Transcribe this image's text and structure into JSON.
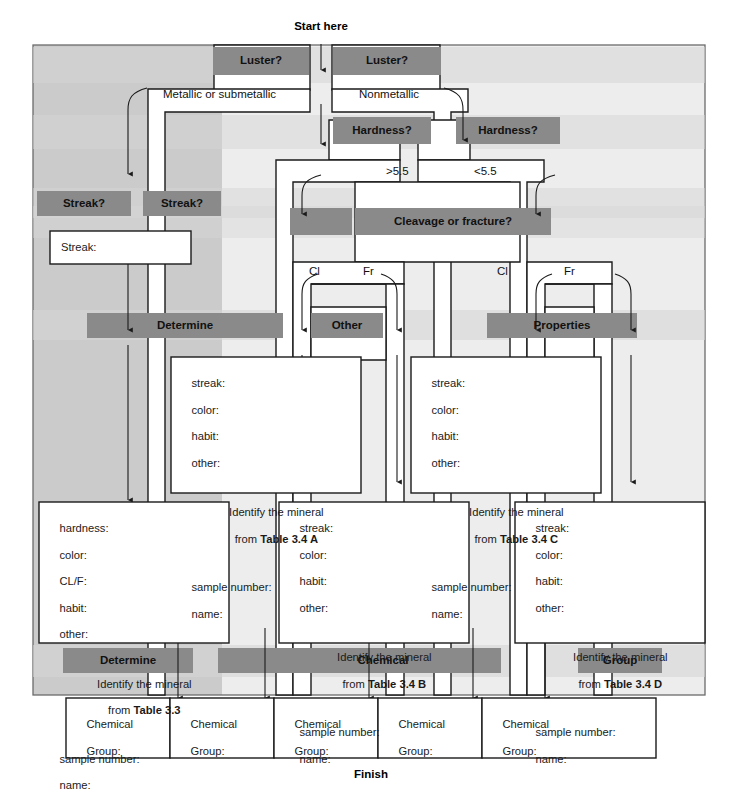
{
  "flow": {
    "start_label": "Start here",
    "finish_label": "Finish"
  },
  "bars": {
    "row_luster": [
      {
        "id": "luster-left",
        "label": "Luster?"
      },
      {
        "id": "luster-right",
        "label": "Luster?"
      }
    ],
    "row_hardness": [
      {
        "id": "hardness-left",
        "label": "Hardness?"
      },
      {
        "id": "hardness-right",
        "label": "Hardness?"
      }
    ],
    "row_streak": [
      {
        "id": "streak-left",
        "label": "Streak?"
      },
      {
        "id": "streak-right",
        "label": "Streak?"
      }
    ],
    "row_cleavage": [
      {
        "id": "cleavage",
        "label": "Cleavage or fracture?"
      }
    ],
    "row_determine_other_properties": [
      {
        "id": "determine",
        "label": "Determine"
      },
      {
        "id": "other",
        "label": "Other"
      },
      {
        "id": "properties",
        "label": "Properties"
      }
    ],
    "row_determine_chemical_group": [
      {
        "id": "determine2",
        "label": "Determine"
      },
      {
        "id": "chemical",
        "label": "Chemical"
      },
      {
        "id": "group",
        "label": "Group"
      }
    ]
  },
  "branch_labels": {
    "metallic": "Metallic or submetallic",
    "nonmetallic": "Nonmetallic",
    "hard_gt": ">5.5",
    "hard_lt": "<5.5",
    "cl_left": "Cl",
    "fr_left": "Fr",
    "cl_right": "Cl",
    "fr_right": "Fr"
  },
  "streak_box": {
    "label": "Streak:"
  },
  "record_boxes": [
    {
      "id": "table-3-4-a",
      "fields": [
        "streak:",
        "color:",
        "habit:",
        "other:"
      ],
      "identify_line1": "Identify the mineral",
      "identify_prefix": "from ",
      "identify_table": "Table 3.4 A",
      "footer": [
        "sample number:",
        "name:"
      ]
    },
    {
      "id": "table-3-4-c",
      "fields": [
        "streak:",
        "color:",
        "habit:",
        "other:"
      ],
      "identify_line1": "Identify the mineral",
      "identify_prefix": "from ",
      "identify_table": "Table 3.4 C",
      "footer": [
        "sample number:",
        "name:"
      ]
    },
    {
      "id": "table-3-3",
      "fields": [
        "hardness:",
        "color:",
        "CL/F:",
        "habit:",
        "other:"
      ],
      "identify_line1": "Identify the mineral",
      "identify_prefix": "from ",
      "identify_table": "Table 3.3",
      "footer": [
        "sample number:",
        "name:"
      ]
    },
    {
      "id": "table-3-4-b",
      "fields": [
        "streak:",
        "color:",
        "habit:",
        "other:"
      ],
      "identify_line1": "Identify the mineral",
      "identify_prefix": "from ",
      "identify_table": "Table 3.4 B",
      "footer": [
        "sample number:",
        "name:"
      ]
    },
    {
      "id": "table-3-4-d",
      "fields": [
        "streak:",
        "color:",
        "habit:",
        "other:"
      ],
      "identify_line1": "Identify the mineral",
      "identify_prefix": "from ",
      "identify_table": "Table 3.4 D",
      "footer": [
        "sample number:",
        "name:"
      ]
    }
  ],
  "chemical_group_cells": [
    {
      "line1": "Chemical",
      "line2": "Group:"
    },
    {
      "line1": "Chemical",
      "line2": "Group:"
    },
    {
      "line1": "Chemical",
      "line2": "Group:"
    },
    {
      "line1": "Chemical",
      "line2": "Group:"
    },
    {
      "line1": "Chemical",
      "line2": "Group:"
    }
  ],
  "colors": {
    "panel_left": "#cbcbcb",
    "panel_right": "#ededed",
    "band_light": "#d6d6d6",
    "bar_dark": "#8a8a8a",
    "box_fill": "#ffffff",
    "stroke": "#1a1a1a",
    "text": "#1a1a1a"
  }
}
